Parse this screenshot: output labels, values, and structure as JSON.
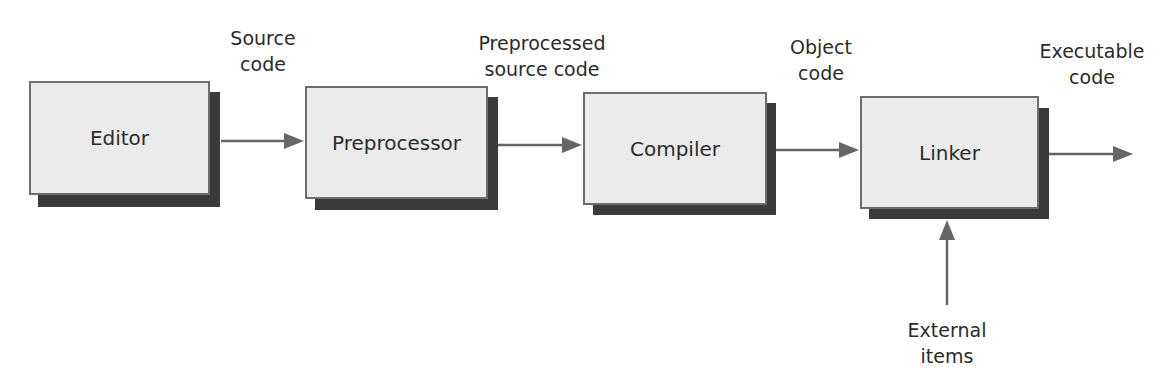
{
  "diagram": {
    "type": "flowchart",
    "direction": "left-to-right",
    "nodes": [
      {
        "id": "editor",
        "label": "Editor"
      },
      {
        "id": "preprocessor",
        "label": "Preprocessor"
      },
      {
        "id": "compiler",
        "label": "Compiler"
      },
      {
        "id": "linker",
        "label": "Linker"
      }
    ],
    "edges": [
      {
        "from": "editor",
        "to": "preprocessor",
        "label_line1": "Source",
        "label_line2": "code"
      },
      {
        "from": "preprocessor",
        "to": "compiler",
        "label_line1": "Preprocessed",
        "label_line2": "source code"
      },
      {
        "from": "compiler",
        "to": "linker",
        "label_line1": "Object",
        "label_line2": "code"
      },
      {
        "from": "linker",
        "to": "output",
        "label_line1": "Executable",
        "label_line2": "code"
      },
      {
        "from": "external",
        "to": "linker",
        "label_line1": "External",
        "label_line2": "items"
      }
    ],
    "colors": {
      "box_fill": "#ebebeb",
      "box_border": "#6d6d6d",
      "shadow": "#3a3a3a",
      "arrow": "#666666"
    }
  }
}
